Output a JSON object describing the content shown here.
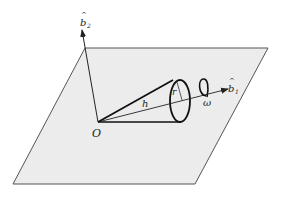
{
  "diagram": {
    "plane": {
      "fill": "#ececec",
      "stroke": "#555555"
    },
    "labels": {
      "origin": "O",
      "height": "h",
      "radius": "r",
      "omega": "ω",
      "b1": "b",
      "b1_sub": "1",
      "b2": "b",
      "b2_sub": "2",
      "hat": "^"
    },
    "axes": [
      {
        "name": "b1",
        "from": [
          98,
          122
        ],
        "to": [
          228,
          89
        ]
      },
      {
        "name": "b2",
        "from": [
          98,
          122
        ],
        "to": [
          82,
          32
        ]
      }
    ]
  }
}
